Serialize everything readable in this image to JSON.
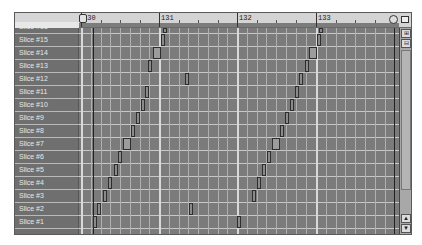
{
  "ruler": {
    "labels": [
      "130",
      "131",
      "132",
      "133"
    ],
    "locator_left": "L",
    "locator_right": "R"
  },
  "tracks": {
    "partial_top_label": "Slice #16",
    "labels": [
      "Slice #15",
      "Slice #14",
      "Slice #13",
      "Slice #12",
      "Slice #11",
      "Slice #10",
      "Slice #9",
      "Slice #8",
      "Slice #7",
      "Slice #6",
      "Slice #5",
      "Slice #4",
      "Slice #3",
      "Slice #2",
      "Slice #1"
    ]
  },
  "scrollbar": {
    "zoom_in_icon": "magnify-plus",
    "zoom_out_icon": "magnify-minus",
    "up_arrow": "▲",
    "down_arrow": "▼"
  },
  "toolbar": {
    "top_right_button": "▭"
  }
}
